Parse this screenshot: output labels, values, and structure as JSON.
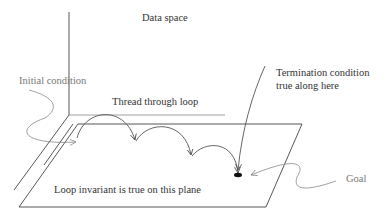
{
  "diagram": {
    "title": "Data space",
    "labels": {
      "data_space": "Data space",
      "initial_condition": "Initial condition",
      "thread": "Thread through loop",
      "termination_line1": "Termination condition",
      "termination_line2": "true along here",
      "invariant": "Loop invariant is true on this plane",
      "goal": "Goal"
    },
    "colors": {
      "line": "#444444",
      "light_line": "#888888",
      "text": "#333333",
      "grey_text": "#777777",
      "goal_dot": "#111111"
    }
  }
}
